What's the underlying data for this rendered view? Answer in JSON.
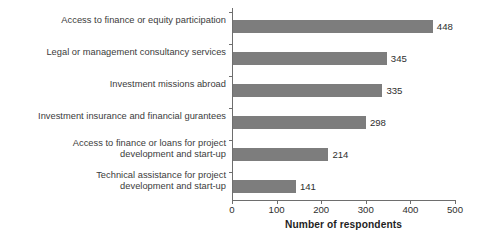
{
  "chart_data": {
    "type": "bar",
    "orientation": "horizontal",
    "title": "",
    "xlabel": "Number of respondents",
    "ylabel": "",
    "xlim": [
      0,
      500
    ],
    "xticks": [
      0,
      100,
      200,
      300,
      400,
      500
    ],
    "grid": false,
    "legend": null,
    "bar_color": "#7d7d7d",
    "axis_color": "#6e6e6e",
    "categories": [
      "Access to finance or equity participation",
      "Legal or management consultancy services",
      "Investment missions abroad",
      "Investment insurance and financial gurantees",
      "Access to finance or loans for project\ndevelopment and start-up",
      "Technical assistance for project\ndevelopment and start-up"
    ],
    "values": [
      448,
      345,
      335,
      298,
      214,
      141
    ],
    "value_labels": [
      "448",
      "345",
      "335",
      "298",
      "214",
      "141"
    ],
    "xtick_labels": [
      "0",
      "100",
      "200",
      "300",
      "400",
      "500"
    ]
  }
}
